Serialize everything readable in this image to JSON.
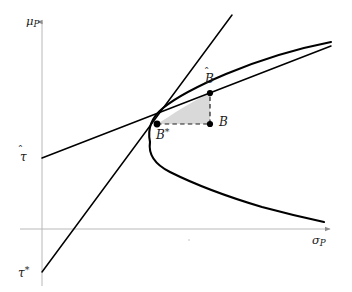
{
  "figure": {
    "type": "diagram",
    "title": "",
    "background_color": "#ffffff",
    "width": 352,
    "height": 292
  },
  "axes": {
    "y_axis": {
      "name": "mu-P",
      "label_base": "μ",
      "label_sub": "P",
      "color": "#b0b0b0",
      "x": 42,
      "y_top": 20,
      "y_bottom": 286,
      "arrow": "up"
    },
    "x_axis": {
      "name": "sigma-P",
      "label_base": "σ",
      "label_sub": "P",
      "color": "#b0b0b0",
      "y": 229,
      "x_left": 20,
      "x_right": 332,
      "arrow": "right"
    }
  },
  "tick_labels": [
    {
      "name": "tau-hat",
      "base": "τ",
      "accent": "̂",
      "axis": "y",
      "pixel_y": 158
    },
    {
      "name": "tau-star",
      "base": "τ",
      "superscript": "*",
      "axis": "y",
      "pixel_y": 272
    }
  ],
  "points": [
    {
      "name": "B-hat",
      "base": "B",
      "accent": "̂",
      "x": 210,
      "y": 93
    },
    {
      "name": "B",
      "base": "B",
      "x": 210,
      "y": 124
    },
    {
      "name": "B-star",
      "base": "B",
      "superscript": "*",
      "x": 157,
      "y": 124
    }
  ],
  "curves": [
    {
      "name": "efficient-frontier-hyperbola",
      "style": "solid",
      "color": "#000000",
      "width": 2.0,
      "description": "Hyperbola opening rightward with vertex near sigma-min"
    },
    {
      "name": "capital-market-line-tau-hat",
      "style": "solid",
      "color": "#000000",
      "width": 1.4,
      "description": "Line from tau-hat intercept tangent to upper branch"
    },
    {
      "name": "capital-market-line-tau-star",
      "style": "solid",
      "color": "#000000",
      "width": 1.4,
      "description": "Steep line from tau-star intercept through B-star"
    },
    {
      "name": "shaded-triangle",
      "style": "filled",
      "fill": "#d9d9d9",
      "description": "Region bounded by B-star, B-hat and B"
    },
    {
      "name": "dashed-connector-b-to-bhat",
      "style": "dashed",
      "color": "#222222"
    },
    {
      "name": "dashed-connector-bstar-to-b",
      "style": "dashed",
      "color": "#222222"
    }
  ],
  "colors": {
    "curve": "#000000",
    "axis": "#b0b0b0",
    "shade": "#d9d9d9",
    "dash": "#222222",
    "text": "#1a1a1a"
  }
}
